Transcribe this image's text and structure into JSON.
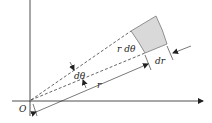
{
  "diagram": {
    "labels": {
      "origin": "O",
      "arc_length": "r dθ",
      "radial_width": "dr",
      "angle": "dθ",
      "radius": "r"
    },
    "colors": {
      "line": "#222222",
      "sector_fill": "#d9d9d9",
      "sector_stroke": "#777777",
      "background": "#ffffff"
    }
  }
}
